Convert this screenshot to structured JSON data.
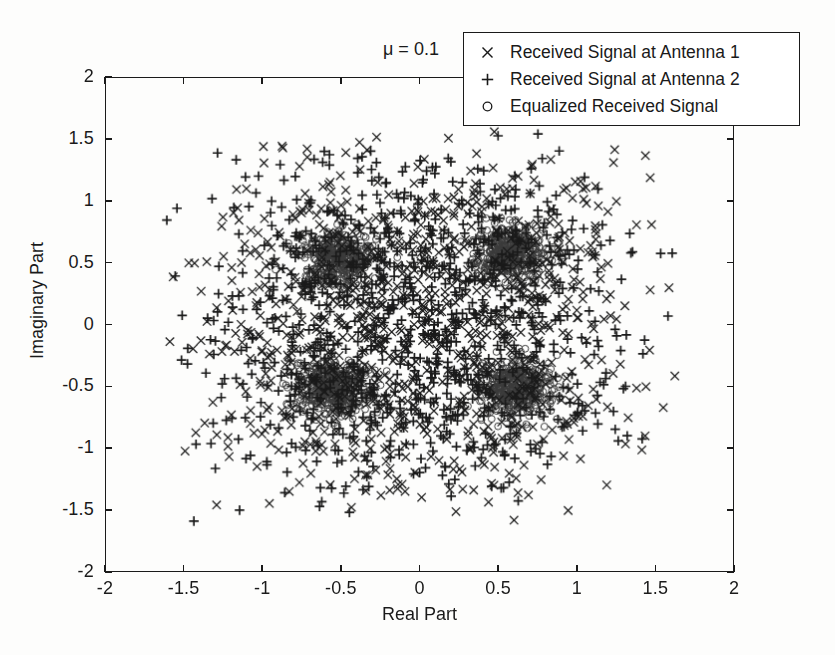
{
  "figure": {
    "annotation": "μ = 0.1",
    "background_color": "#fdfdfc",
    "foreground_color": "#1a1a1a"
  },
  "axes": {
    "x": {
      "label": "Real Part",
      "ticks": [
        "-2",
        "-1.5",
        "-1",
        "-0.5",
        "0",
        "0.5",
        "1",
        "1.5",
        "2"
      ],
      "tick_values": [
        -2,
        -1.5,
        -1,
        -0.5,
        0,
        0.5,
        1,
        1.5,
        2
      ],
      "limits": [
        -2,
        2
      ]
    },
    "y": {
      "label": "Imaginary Part",
      "ticks": [
        "2",
        "1.5",
        "1",
        "0.5",
        "0",
        "-0.5",
        "-1",
        "-1.5",
        "-2"
      ],
      "tick_values": [
        2,
        1.5,
        1,
        0.5,
        0,
        -0.5,
        -1,
        -1.5,
        -2
      ],
      "limits": [
        -2,
        2
      ]
    }
  },
  "legend": {
    "position": "top-right",
    "entries": [
      {
        "marker": "x-marker",
        "glyph": "×",
        "label": "Received Signal at Antenna 1"
      },
      {
        "marker": "plus-marker",
        "glyph": "+",
        "label": "Received Signal at Antenna 2"
      },
      {
        "marker": "circle-marker",
        "glyph": "○",
        "label": "Equalized Received Signal"
      }
    ]
  },
  "chart_data": {
    "type": "scatter",
    "title": "",
    "subtitle": "",
    "xlabel": "Real Part",
    "ylabel": "Imaginary Part",
    "xlim": [
      -2,
      2
    ],
    "ylim": [
      -2,
      2
    ],
    "xticks": [
      -2,
      -1.5,
      -1,
      -0.5,
      0,
      0.5,
      1,
      1.5,
      2
    ],
    "yticks": [
      -2,
      -1.5,
      -1,
      -0.5,
      0,
      0.5,
      1,
      1.5,
      2
    ],
    "grid": false,
    "legend_position": "upper right",
    "annotations": [
      {
        "text": "μ = 0.1",
        "x": -0.22,
        "y": 2.28
      }
    ],
    "series": [
      {
        "name": "Received Signal at Antenna 1",
        "marker": "x",
        "color": "#1a1a1a",
        "n_points": 1000,
        "distribution": "gaussian-cloud-about-qpsk-constellation",
        "constellation_centers": [
          [
            -0.5,
            0.5
          ],
          [
            0.5,
            0.5
          ],
          [
            -0.5,
            -0.5
          ],
          [
            0.5,
            -0.5
          ]
        ],
        "noise_std": 0.45,
        "spread_extent": [
          [
            -1.65,
            1.65
          ],
          [
            -1.6,
            1.6
          ]
        ]
      },
      {
        "name": "Received Signal at Antenna 2",
        "marker": "+",
        "color": "#1a1a1a",
        "n_points": 1000,
        "distribution": "gaussian-cloud-about-qpsk-constellation",
        "constellation_centers": [
          [
            -0.5,
            0.5
          ],
          [
            0.5,
            0.5
          ],
          [
            -0.5,
            -0.5
          ],
          [
            0.5,
            -0.5
          ]
        ],
        "noise_std": 0.45,
        "spread_extent": [
          [
            -1.65,
            1.65
          ],
          [
            -1.6,
            1.6
          ]
        ]
      },
      {
        "name": "Equalized Received Signal",
        "marker": "o",
        "color": "#3a3a3a",
        "n_points": 1600,
        "distribution": "tight-cluster-about-qpsk-constellation",
        "constellation_centers": [
          [
            -0.52,
            0.54
          ],
          [
            0.57,
            0.58
          ],
          [
            -0.55,
            -0.52
          ],
          [
            0.61,
            -0.52
          ]
        ],
        "noise_std": 0.11,
        "spread_extent": [
          [
            -0.95,
            1.0
          ],
          [
            -0.95,
            1.0
          ]
        ]
      }
    ]
  }
}
